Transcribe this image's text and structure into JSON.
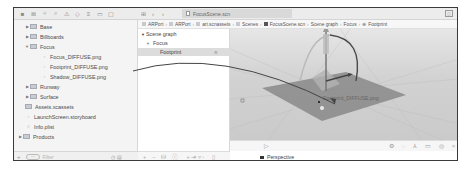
{
  "toolbar": {
    "navigator_icons": [
      "folder-icon",
      "source-control-icon",
      "hierarchy-icon",
      "search-icon",
      "warning-icon",
      "test-icon",
      "debug-icon",
      "breakpoint-icon",
      "report-icon"
    ],
    "tab_file": "FocusScene.scn",
    "back_label": "‹",
    "forward_label": "›"
  },
  "navigator": {
    "items": [
      {
        "label": "Base",
        "type": "folder",
        "indent": 1,
        "expanded": false
      },
      {
        "label": "Billboards",
        "type": "folder",
        "indent": 1,
        "expanded": false
      },
      {
        "label": "Focus",
        "type": "folder",
        "indent": 1,
        "expanded": true
      },
      {
        "label": "Focus_DIFFUSE.png",
        "type": "file",
        "indent": 2
      },
      {
        "label": "Footprint_DIFFUSE.png",
        "type": "file",
        "indent": 2
      },
      {
        "label": "Shadow_DIFFUSE.png",
        "type": "file",
        "indent": 2
      },
      {
        "label": "Runway",
        "type": "folder",
        "indent": 1,
        "expanded": false
      },
      {
        "label": "Surface",
        "type": "folder",
        "indent": 1,
        "expanded": false
      },
      {
        "label": "Assets.xcassets",
        "type": "asset",
        "indent": 0
      },
      {
        "label": "LaunchScreen.storyboard",
        "type": "file",
        "indent": 0
      },
      {
        "label": "Info.plist",
        "type": "file",
        "indent": 0
      },
      {
        "label": "Products",
        "type": "folder",
        "indent": -1,
        "expanded": false
      }
    ],
    "filter_placeholder": "Filter",
    "add_label": "+"
  },
  "breadcrumb": [
    "ARPort",
    "ARPort",
    "art.scnassets",
    "Scenes",
    "FocusScene.scn",
    "Scene graph",
    "Focus",
    "Footprint"
  ],
  "scene_graph": {
    "title": "Scene graph",
    "nodes": [
      {
        "label": "Focus",
        "selected": false
      },
      {
        "label": "Footprint",
        "selected": true
      }
    ]
  },
  "viewport": {
    "overlay_label": "Footprint_DIFFUSE.png",
    "camera_label": "Perspective"
  },
  "colors": {
    "plane": "#8f8f8f",
    "background": "#d0d0d0",
    "window_border": "#3a3a3a"
  }
}
